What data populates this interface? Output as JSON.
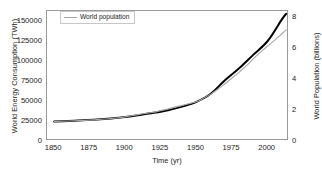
{
  "chart_data": {
    "type": "line",
    "title": "",
    "xlabel": "Time (yr)",
    "ylabel": "World Energy Consumption (TWh)",
    "ylabel_right": "World Population (billions)",
    "xlim": [
      1845,
      2015
    ],
    "ylim": [
      0,
      162500
    ],
    "ylim_right": [
      0,
      8.4
    ],
    "grid": false,
    "legend_position": "top-left",
    "xticks": [
      {
        "value": 1850,
        "label": "1850"
      },
      {
        "value": 1875,
        "label": "1875"
      },
      {
        "value": 1900,
        "label": "1900"
      },
      {
        "value": 1925,
        "label": "1925"
      },
      {
        "value": 1950,
        "label": "1950"
      },
      {
        "value": 1975,
        "label": "1975"
      },
      {
        "value": 2000,
        "label": "2000"
      }
    ],
    "yticks_left": [
      {
        "value": 0,
        "label": "0"
      },
      {
        "value": 25000,
        "label": "25000"
      },
      {
        "value": 50000,
        "label": "50000"
      },
      {
        "value": 75000,
        "label": "75000"
      },
      {
        "value": 100000,
        "label": "100000"
      },
      {
        "value": 125000,
        "label": "125000"
      },
      {
        "value": 150000,
        "label": "150000"
      }
    ],
    "yticks_right": [
      {
        "value": 0,
        "label": "0"
      },
      {
        "value": 2,
        "label": "2"
      },
      {
        "value": 4,
        "label": "4"
      },
      {
        "value": 6,
        "label": "6"
      },
      {
        "value": 8,
        "label": "8"
      }
    ],
    "series": [
      {
        "name": "World energy consumption",
        "axis": "left",
        "color": "#000000",
        "width": 2.0,
        "unit": "TWh",
        "x": [
          1850,
          1860,
          1870,
          1880,
          1890,
          1900,
          1910,
          1920,
          1930,
          1940,
          1950,
          1960,
          1970,
          1980,
          1990,
          2000,
          2010,
          2013
        ],
        "values": [
          24500,
          25000,
          25800,
          26800,
          28200,
          30000,
          32500,
          35200,
          38500,
          43000,
          49000,
          59000,
          76000,
          91000,
          108000,
          125000,
          152000,
          159000
        ]
      },
      {
        "name": "World population",
        "axis": "right",
        "color": "#a8a8a8",
        "width": 1.1,
        "unit": "billions",
        "x": [
          1850,
          1860,
          1870,
          1880,
          1890,
          1900,
          1910,
          1920,
          1930,
          1940,
          1950,
          1955,
          1960,
          1965,
          1970,
          1975,
          1980,
          1985,
          1990,
          1995,
          2000,
          2005,
          2010,
          2013
        ],
        "values": [
          1.26,
          1.29,
          1.33,
          1.38,
          1.45,
          1.56,
          1.72,
          1.86,
          2.07,
          2.3,
          2.54,
          2.77,
          3.03,
          3.34,
          3.7,
          4.07,
          4.45,
          4.85,
          5.32,
          5.74,
          6.14,
          6.52,
          6.93,
          7.18
        ]
      }
    ],
    "legend": [
      {
        "label": "World population",
        "color": "#a8a8a8"
      }
    ]
  }
}
